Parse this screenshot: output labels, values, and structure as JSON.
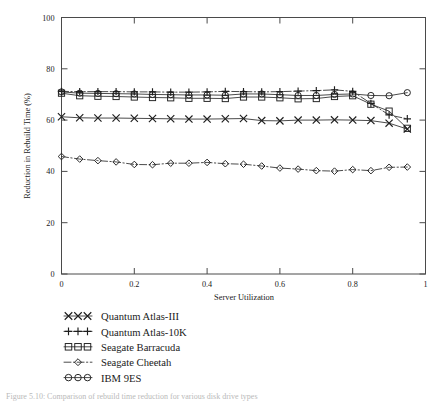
{
  "figure": {
    "background_color": "#ffffff",
    "ink_color": "#1e1e1e",
    "caption_partial": "Figure 5.10: Comparison of rebuild time reduction for various disk drive types"
  },
  "chart_data": {
    "type": "line",
    "title": "",
    "xlabel": "Server Utilization",
    "ylabel": "Reduction in Rebuild Time (%)",
    "xlim": [
      0,
      1
    ],
    "ylim": [
      0,
      100
    ],
    "xticks": [
      0,
      0.2,
      0.4,
      0.6,
      0.8,
      1
    ],
    "xticklabels": [
      "0",
      "0.2",
      "0.4",
      "0.6",
      "0.8",
      "1"
    ],
    "yticks": [
      0,
      20,
      40,
      60,
      80,
      100
    ],
    "yticklabels": [
      "0",
      "20",
      "40",
      "60",
      "80",
      "100"
    ],
    "grid": false,
    "legend_position": "below-left",
    "x": [
      0,
      0.05,
      0.1,
      0.15,
      0.2,
      0.25,
      0.3,
      0.35,
      0.4,
      0.45,
      0.5,
      0.55,
      0.6,
      0.65,
      0.7,
      0.75,
      0.8,
      0.85,
      0.9,
      0.95
    ],
    "series": [
      {
        "name": "Quantum Atlas-III",
        "marker": "x",
        "linestyle": "solid",
        "values": [
          61.3,
          60.9,
          60.8,
          60.8,
          60.7,
          60.6,
          60.5,
          60.4,
          60.4,
          60.5,
          60.6,
          59.8,
          59.7,
          60.0,
          60.0,
          60.1,
          60.0,
          59.8,
          58.8,
          56.5
        ]
      },
      {
        "name": "Quantum Atlas-10K",
        "marker": "plus",
        "linestyle": "dashdot",
        "values": [
          71.2,
          71.1,
          71.1,
          71.1,
          71.0,
          71.0,
          70.9,
          70.9,
          71.0,
          71.2,
          71.1,
          71.0,
          71.1,
          71.3,
          71.5,
          71.8,
          71.2,
          66.5,
          62.0,
          60.5
        ]
      },
      {
        "name": "Seagate Barracuda",
        "marker": "square",
        "linestyle": "solid",
        "values": [
          70.5,
          69.5,
          69.3,
          69.2,
          69.0,
          68.8,
          68.7,
          68.5,
          68.5,
          68.4,
          69.0,
          69.0,
          68.7,
          68.3,
          68.4,
          69.2,
          69.5,
          66.2,
          63.5,
          56.8
        ]
      },
      {
        "name": "Seagate Cheetah",
        "marker": "diamond",
        "linestyle": "dashdot",
        "values": [
          45.8,
          44.8,
          44.2,
          43.7,
          42.7,
          42.6,
          43.2,
          43.2,
          43.5,
          43.0,
          42.8,
          42.1,
          41.3,
          40.9,
          40.3,
          40.1,
          40.7,
          40.3,
          41.6,
          41.7
        ]
      },
      {
        "name": "IBM 9ES",
        "marker": "circle",
        "linestyle": "solid",
        "values": [
          71.0,
          70.5,
          70.4,
          70.3,
          70.2,
          70.0,
          69.9,
          69.8,
          69.8,
          69.7,
          70.2,
          70.2,
          69.9,
          69.6,
          69.6,
          70.0,
          70.2,
          69.6,
          69.5,
          70.7
        ]
      }
    ]
  },
  "legend": {
    "entries": [
      {
        "label": "Quantum Atlas-III",
        "marker": "x-marker"
      },
      {
        "label": "Quantum Atlas-10K",
        "marker": "plus-marker"
      },
      {
        "label": "Seagate Barracuda",
        "marker": "square-marker"
      },
      {
        "label": "Seagate Cheetah",
        "marker": "diamond-marker"
      },
      {
        "label": "IBM 9ES",
        "marker": "circle-marker"
      }
    ]
  }
}
